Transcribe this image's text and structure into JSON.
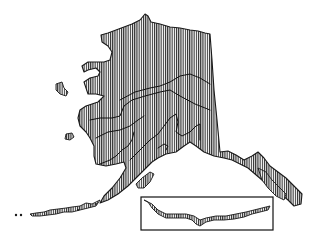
{
  "map": {
    "subject": "Alaska",
    "fill_style": "vertical-hatch",
    "colors": {
      "ink": "#1a1a1a",
      "background": "#ffffff"
    },
    "regions": [
      {
        "name": "north-slope"
      },
      {
        "name": "interior"
      },
      {
        "name": "yukon-kuskokwim"
      },
      {
        "name": "southwest"
      },
      {
        "name": "southcentral"
      },
      {
        "name": "southeast-panhandle"
      }
    ],
    "inset": {
      "name": "aleutian-islands-inset"
    }
  }
}
